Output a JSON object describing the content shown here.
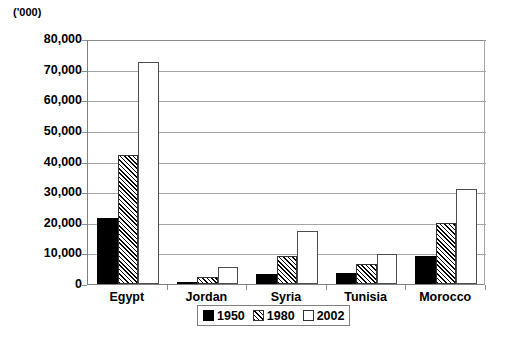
{
  "chart_data": {
    "type": "bar",
    "title": "",
    "units_label": "('000)",
    "xlabel": "",
    "ylabel": "",
    "ylim": [
      0,
      80000
    ],
    "ytick_step": 10000,
    "ytick_labels": [
      "80,000",
      "70,000",
      "60,000",
      "50,000",
      "40,000",
      "30,000",
      "20,000",
      "10,000",
      "0"
    ],
    "ytick_values": [
      80000,
      70000,
      60000,
      50000,
      40000,
      30000,
      20000,
      10000,
      0
    ],
    "grid": true,
    "grid_axis": "y",
    "legend_position": "bottom-center",
    "categories": [
      "Egypt",
      "Jordan",
      "Syria",
      "Tunisia",
      "Morocco"
    ],
    "series": [
      {
        "name": "1950",
        "fill": "solid-black",
        "values": [
          21500,
          600,
          3400,
          3500,
          9300
        ]
      },
      {
        "name": "1980",
        "fill": "diagonal-hatch",
        "values": [
          42000,
          2200,
          9000,
          6400,
          19900
        ]
      },
      {
        "name": "2002",
        "fill": "white-outline",
        "values": [
          72500,
          5400,
          17200,
          9800,
          31000
        ]
      }
    ]
  },
  "colors": {
    "series_1950": "#000000",
    "series_1980": "#000000",
    "series_2002": "#ffffff",
    "gridline": "#a6a6a6",
    "axis": "#808080",
    "text": "#000000",
    "background": "#ffffff"
  }
}
